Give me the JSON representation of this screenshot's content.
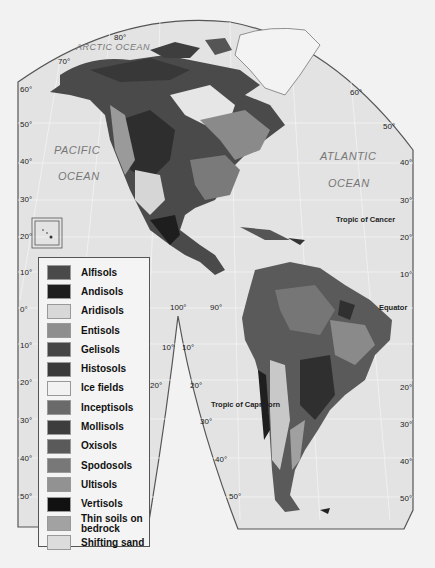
{
  "map": {
    "title_labels": {
      "arctic_ocean": "ARCTIC OCEAN",
      "pacific_1": "PACIFIC",
      "pacific_2": "OCEAN",
      "atlantic_1": "ATLANTIC",
      "atlantic_2": "OCEAN",
      "tropic_cancer": "Tropic of Cancer",
      "tropic_capricorn": "Tropic of Capricorn",
      "equator": "Equator"
    },
    "lat_left": [
      "60°",
      "50°",
      "40°",
      "30°",
      "20°",
      "10°",
      "0°",
      "10°",
      "20°",
      "30°",
      "40°",
      "50°"
    ],
    "lat_right": [
      "60°",
      "50°",
      "40°",
      "30°",
      "20°",
      "10°",
      "20°",
      "30°",
      "40°",
      "50°"
    ],
    "lat_inner": [
      "10°",
      "10°",
      "20°",
      "20°",
      "30°",
      "40°",
      "50°"
    ],
    "lon_top": [
      "80°",
      "70°"
    ],
    "lon_mid": [
      "100°",
      "90°"
    ]
  },
  "legend": {
    "items": [
      {
        "label": "Alfisols",
        "color": "#4a4a4a"
      },
      {
        "label": "Andisols",
        "color": "#1e1e1e"
      },
      {
        "label": "Aridisols",
        "color": "#d8d8d8"
      },
      {
        "label": "Entisols",
        "color": "#8e8e8e"
      },
      {
        "label": "Gelisols",
        "color": "#454545"
      },
      {
        "label": "Histosols",
        "color": "#3a3a3a"
      },
      {
        "label": "Ice fields",
        "color": "#f2f2f2"
      },
      {
        "label": "Inceptisols",
        "color": "#6a6a6a"
      },
      {
        "label": "Mollisols",
        "color": "#3d3d3d"
      },
      {
        "label": "Oxisols",
        "color": "#5a5a5a"
      },
      {
        "label": "Spodosols",
        "color": "#787878"
      },
      {
        "label": "Ultisols",
        "color": "#929292"
      },
      {
        "label": "Vertisols",
        "color": "#111111"
      },
      {
        "label": "Thin soils on bedrock",
        "color": "#a2a2a2"
      },
      {
        "label": "Shifting sand",
        "color": "#dcdcdc"
      }
    ]
  }
}
